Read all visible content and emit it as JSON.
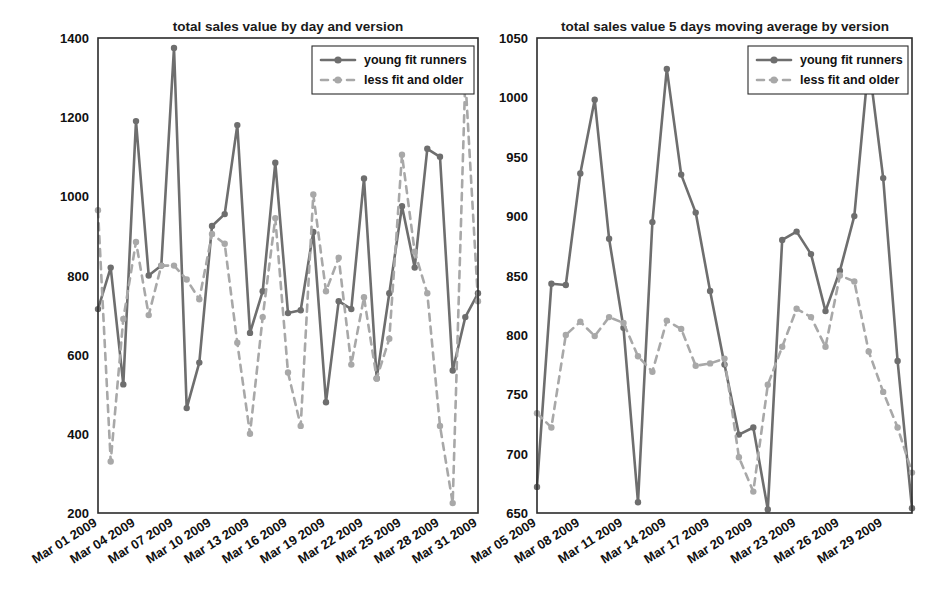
{
  "figure": {
    "width": 941,
    "height": 595,
    "background": "#ffffff"
  },
  "colors": {
    "series_a": "#6e6e6e",
    "series_b": "#a8a8a8",
    "axis": "#2b2b2b",
    "text": "#111111"
  },
  "chart_data": [
    {
      "id": "left",
      "type": "line",
      "title": "total sales value by day and version",
      "xlabel": "",
      "ylabel": "",
      "grid": false,
      "legend_position": "top-right",
      "ylim": [
        200,
        1400
      ],
      "yticks": [
        200,
        400,
        600,
        800,
        1000,
        1200,
        1400
      ],
      "ytick_labels": [
        "200",
        "400",
        "600",
        "800",
        "1000",
        "1200",
        "1400"
      ],
      "xtick_labels": [
        "Mar 01 2009",
        "Mar 04 2009",
        "Mar 07 2009",
        "Mar 10 2009",
        "Mar 13 2009",
        "Mar 16 2009",
        "Mar 19 2009",
        "Mar 22 2009",
        "Mar 25 2009",
        "Mar 28 2009",
        "Mar 31 2009"
      ],
      "xtick_positions": [
        0,
        3,
        6,
        9,
        12,
        15,
        18,
        21,
        24,
        27,
        30
      ],
      "x": [
        0,
        1,
        2,
        3,
        4,
        5,
        6,
        7,
        8,
        9,
        10,
        11,
        12,
        13,
        14,
        15,
        16,
        17,
        18,
        19,
        20,
        21,
        22,
        23,
        24,
        25,
        26,
        27,
        28,
        29,
        30
      ],
      "series": [
        {
          "name": "young fit runners",
          "style": "solid",
          "color": "#6e6e6e",
          "values": [
            715,
            820,
            525,
            1190,
            800,
            825,
            1375,
            465,
            580,
            925,
            955,
            1180,
            655,
            760,
            1085,
            705,
            712,
            910,
            480,
            735,
            715,
            1045,
            540,
            755,
            975,
            820,
            1120,
            1100,
            560,
            695,
            755
          ]
        },
        {
          "name": "less fit and older",
          "style": "dashed",
          "color": "#a8a8a8",
          "values": [
            965,
            330,
            690,
            885,
            700,
            825,
            825,
            790,
            740,
            905,
            880,
            630,
            400,
            695,
            945,
            555,
            420,
            1005,
            760,
            845,
            575,
            745,
            540,
            640,
            1105,
            860,
            755,
            420,
            225,
            1300,
            735
          ]
        }
      ]
    },
    {
      "id": "right",
      "type": "line",
      "title": "total sales value 5 days moving average by version",
      "xlabel": "",
      "ylabel": "",
      "grid": false,
      "legend_position": "top-right",
      "ylim": [
        650,
        1050
      ],
      "yticks": [
        650,
        700,
        750,
        800,
        850,
        900,
        950,
        1000,
        1050
      ],
      "ytick_labels": [
        "650",
        "700",
        "750",
        "800",
        "850",
        "900",
        "950",
        "1000",
        "1050"
      ],
      "xtick_labels": [
        "Mar 05 2009",
        "Mar 08 2009",
        "Mar 11 2009",
        "Mar 14 2009",
        "Mar 17 2009",
        "Mar 20 2009",
        "Mar 23 2009",
        "Mar 26 2009",
        "Mar 29 2009"
      ],
      "xtick_positions": [
        0,
        3,
        6,
        9,
        12,
        15,
        18,
        21,
        24
      ],
      "x": [
        0,
        1,
        2,
        3,
        4,
        5,
        6,
        7,
        8,
        9,
        10,
        11,
        12,
        13,
        14,
        15,
        16,
        17,
        18,
        19,
        20,
        21,
        22,
        23,
        24,
        25,
        26
      ],
      "series": [
        {
          "name": "young fit runners",
          "style": "solid",
          "color": "#6e6e6e",
          "values": [
            672,
            843,
            842,
            936,
            998,
            881,
            806,
            659,
            895,
            1024,
            935,
            903,
            837,
            775,
            716,
            722,
            653,
            880,
            887,
            868,
            820,
            854,
            900,
            1030,
            932,
            778,
            654
          ]
        },
        {
          "name": "less fit and older",
          "style": "dashed",
          "color": "#a8a8a8",
          "values": [
            734,
            722,
            800,
            811,
            799,
            815,
            810,
            782,
            769,
            812,
            805,
            774,
            776,
            780,
            697,
            668,
            758,
            790,
            822,
            815,
            790,
            850,
            845,
            786,
            752,
            722,
            684
          ]
        }
      ]
    }
  ],
  "legend": {
    "entries": [
      {
        "label": "young fit runners",
        "style": "solid"
      },
      {
        "label": "less fit and older",
        "style": "dashed"
      }
    ]
  }
}
